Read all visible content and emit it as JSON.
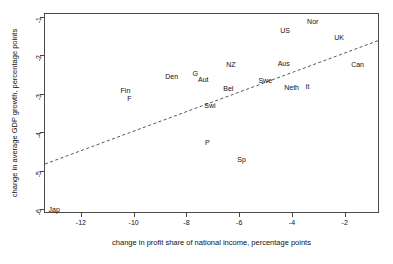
{
  "chart_data": {
    "type": "scatter",
    "title": "",
    "xlabel": "change in profit share of national income, percentage points",
    "ylabel": "change in average GDP growth, percentage points",
    "xlim": [
      -13.4,
      -0.7
    ],
    "ylim": [
      -6.1,
      -0.9
    ],
    "xticks": [
      -12,
      -10,
      -8,
      -6,
      -4,
      -2
    ],
    "xtick_labels": [
      "-12",
      "-10",
      "-8",
      "-6",
      "-4",
      "-2"
    ],
    "yticks": [
      -1,
      -2,
      -3,
      -4,
      -5,
      -6
    ],
    "ytick_labels": [
      "-1",
      "-2",
      "-3",
      "-4",
      "-5",
      "-6"
    ],
    "grid": false,
    "legend": null,
    "marker_style": "text-label",
    "points": [
      {
        "label": "Jap",
        "x": -13.05,
        "y": -6.0
      },
      {
        "label": "Fin",
        "x": -10.35,
        "y": -2.9
      },
      {
        "label": "F",
        "x": -10.2,
        "y": -3.12
      },
      {
        "label": "Den",
        "x": -8.6,
        "y": -2.53
      },
      {
        "label": "G",
        "x": -7.7,
        "y": -2.47
      },
      {
        "label": "Aut",
        "x": -7.4,
        "y": -2.62
      },
      {
        "label": "Swi",
        "x": -7.15,
        "y": -3.3
      },
      {
        "label": "P",
        "x": -7.25,
        "y": -4.26
      },
      {
        "label": "NZ",
        "x": -6.35,
        "y": -2.22
      },
      {
        "label": "Bel",
        "x": -6.45,
        "y": -2.85
      },
      {
        "label": "Sp",
        "x": -5.95,
        "y": -4.7
      },
      {
        "label": "Swe",
        "x": -5.05,
        "y": -2.65
      },
      {
        "label": "Aus",
        "x": -4.35,
        "y": -2.2
      },
      {
        "label": "US",
        "x": -4.3,
        "y": -1.33
      },
      {
        "label": "Neth",
        "x": -4.05,
        "y": -2.82
      },
      {
        "label": "It",
        "x": -3.45,
        "y": -2.8
      },
      {
        "label": "Nor",
        "x": -3.25,
        "y": -1.12
      },
      {
        "label": "UK",
        "x": -2.25,
        "y": -1.52
      },
      {
        "label": "Can",
        "x": -1.55,
        "y": -2.22
      }
    ],
    "trend_line": {
      "style": "dashed",
      "x_start": -13.4,
      "y_start": -4.8,
      "x_end": -0.72,
      "y_end": -1.58
    }
  }
}
